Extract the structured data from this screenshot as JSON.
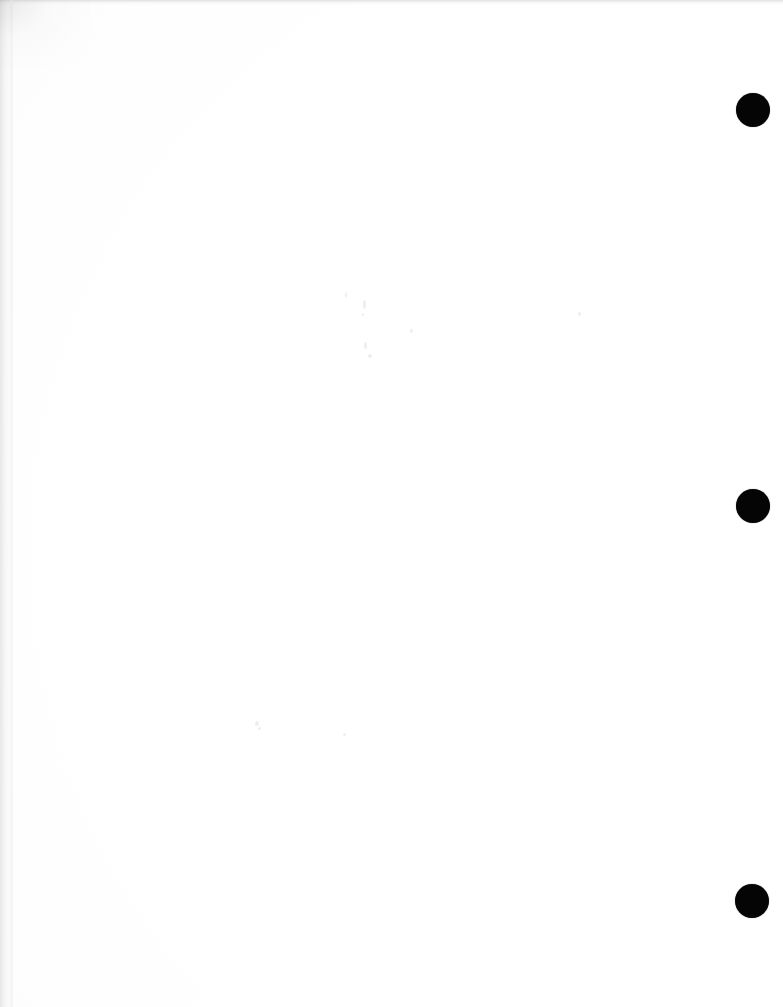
{
  "document": {
    "kind": "scanned-page",
    "title": "Blank scanned page",
    "body_text": "",
    "page_width": 783,
    "page_height": 1007,
    "background_color": "#ffffff",
    "ink_color": "#050505"
  },
  "marks": {
    "punch_holes_label": "binder hole punch marks",
    "punch_holes": [
      {
        "name": "punch-hole-top",
        "cx": 753,
        "cy": 110,
        "r": 17
      },
      {
        "name": "punch-hole-middle",
        "cx": 753,
        "cy": 506,
        "r": 17
      },
      {
        "name": "punch-hole-bottom",
        "cx": 752,
        "cy": 901,
        "r": 17
      }
    ],
    "specks": [
      {
        "x": 345,
        "y": 292,
        "w": 2,
        "h": 6
      },
      {
        "x": 363,
        "y": 300,
        "w": 3,
        "h": 9
      },
      {
        "x": 362,
        "y": 313,
        "w": 2,
        "h": 3
      },
      {
        "x": 578,
        "y": 312,
        "w": 3,
        "h": 4
      },
      {
        "x": 410,
        "y": 329,
        "w": 3,
        "h": 4
      },
      {
        "x": 364,
        "y": 342,
        "w": 3,
        "h": 7
      },
      {
        "x": 368,
        "y": 354,
        "w": 4,
        "h": 4
      },
      {
        "x": 255,
        "y": 721,
        "w": 4,
        "h": 5
      },
      {
        "x": 258,
        "y": 727,
        "w": 3,
        "h": 3
      },
      {
        "x": 343,
        "y": 733,
        "w": 3,
        "h": 3
      }
    ]
  },
  "edges": {
    "top_shadow_label": "top scan edge shadow",
    "left_shadow_label": "left scan edge shadow",
    "corner_shadow_label": "top-left corner scan shadow",
    "seam_label": "left margin seam"
  }
}
